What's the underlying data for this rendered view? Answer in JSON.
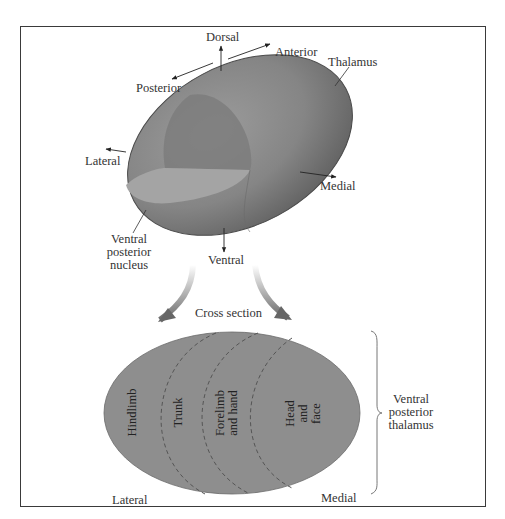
{
  "figure": {
    "top_view": {
      "orientation_labels": {
        "dorsal": "Dorsal",
        "anterior": "Anterior",
        "posterior": "Posterior",
        "lateral": "Lateral",
        "medial": "Medial",
        "ventral": "Ventral"
      },
      "structure_label": "Thalamus",
      "nucleus_label": [
        "Ventral",
        "posterior",
        "nucleus"
      ]
    },
    "transition_label": "Cross section",
    "cross_section": {
      "regions": [
        {
          "label": [
            "Hindlimb"
          ]
        },
        {
          "label": [
            "Trunk"
          ]
        },
        {
          "label": [
            "Forelimb",
            "and hand"
          ]
        },
        {
          "label": [
            "Head",
            "and",
            "face"
          ]
        }
      ],
      "bottom_left_label": "Lateral",
      "bottom_right_label": "Medial",
      "brace_label": [
        "Ventral",
        "posterior",
        "thalamus"
      ]
    },
    "colors": {
      "ellipsoid_fill": "#8a8a8a",
      "ellipsoid_dark": "#5e5e5e",
      "nucleus_top": "#9a9a9a",
      "cross_section_fill": "#8e8e8e",
      "frame_border": "#3a3a3a",
      "text": "#333333"
    }
  }
}
